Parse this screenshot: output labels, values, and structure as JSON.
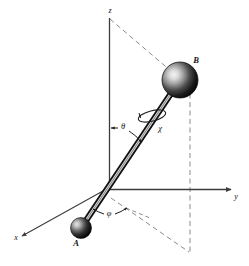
{
  "figure": {
    "background_color": "#ffffff",
    "width": 249,
    "height": 266,
    "axes": {
      "z": {
        "label": "z",
        "x": 110,
        "y": 13
      },
      "y": {
        "label": "y",
        "x": 236,
        "y": 199
      },
      "x": {
        "label": "x",
        "x": 16,
        "y": 240
      }
    },
    "angles": {
      "theta": {
        "label": "θ",
        "x": 123,
        "y": 129
      },
      "phi": {
        "label": "φ",
        "x": 109,
        "y": 215
      },
      "chi": {
        "label": "χ",
        "x": 160,
        "y": 131
      }
    },
    "masses": {
      "A": {
        "label": "A",
        "x": 76,
        "y": 245,
        "cx": 81,
        "cy": 228,
        "r": 10.5
      },
      "B": {
        "label": "B",
        "x": 195,
        "y": 63,
        "cx": 180,
        "cy": 80,
        "r": 18
      }
    },
    "colors": {
      "axis": "#3d3d3d",
      "dashed": "#8b8b8b",
      "rod_outline": "#141414",
      "rod_fill": "#cfcfcf",
      "sphere_dark": "#0d0d0d",
      "sphere_mid": "#4a4a4a",
      "sphere_highlight": "#efefef",
      "text": "#141414"
    }
  }
}
